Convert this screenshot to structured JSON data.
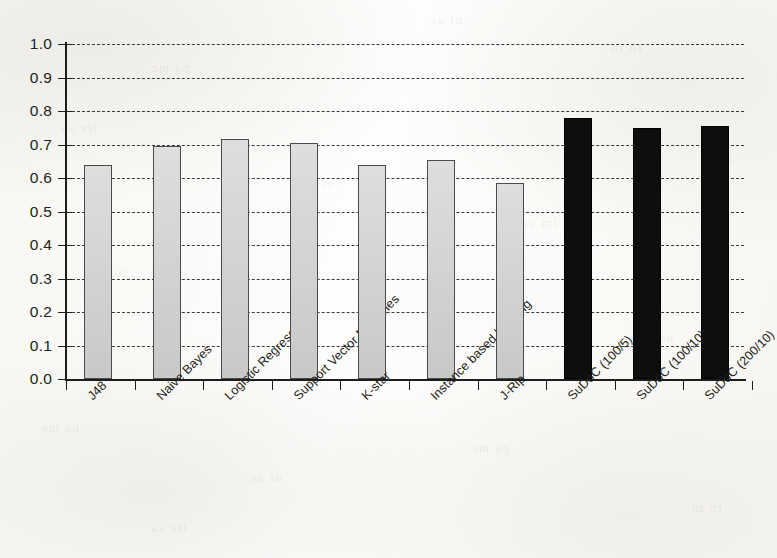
{
  "chart_data": {
    "type": "bar",
    "title": "",
    "xlabel": "",
    "ylabel": "",
    "ylim": [
      0.0,
      1.0
    ],
    "ytick_labels": [
      "1.0",
      "0.9",
      "0.8",
      "0.7",
      "0.6",
      "0.5",
      "0.4",
      "0.3",
      "0.2",
      "0.1",
      "0.0"
    ],
    "ytick_values": [
      1.0,
      0.9,
      0.8,
      0.7,
      0.6,
      0.5,
      0.4,
      0.3,
      0.2,
      0.1,
      0.0
    ],
    "grid": true,
    "grid_style": "dashed-horizontal",
    "legend": "none",
    "categories": [
      "J48",
      "Naive Bayes",
      "Logistic Regression",
      "Support Vector Machines",
      "K-star",
      "Instance based learning",
      "J-Rip",
      "SuDoC (100/5)",
      "SuDoC (100/10)",
      "SuDoC (200/10)"
    ],
    "values": [
      0.64,
      0.695,
      0.715,
      0.705,
      0.64,
      0.655,
      0.585,
      0.78,
      0.75,
      0.755
    ],
    "bar_colors": [
      "#d3d3d3",
      "#d3d3d3",
      "#d3d3d3",
      "#d3d3d3",
      "#d3d3d3",
      "#d3d3d3",
      "#d3d3d3",
      "#0e0e0e",
      "#0e0e0e",
      "#0e0e0e"
    ],
    "highlight_color": "#0e0e0e",
    "baseline_color": "#1d1d1d",
    "xtick_label_rotation": -45
  },
  "bleed_through": [
    "ni as",
    "pa mc",
    "ro tn",
    "ire sa",
    "os ds",
    "lm ue",
    "ta eh",
    "ro tn",
    "ai nl",
    "ne gi",
    "ba me"
  ]
}
